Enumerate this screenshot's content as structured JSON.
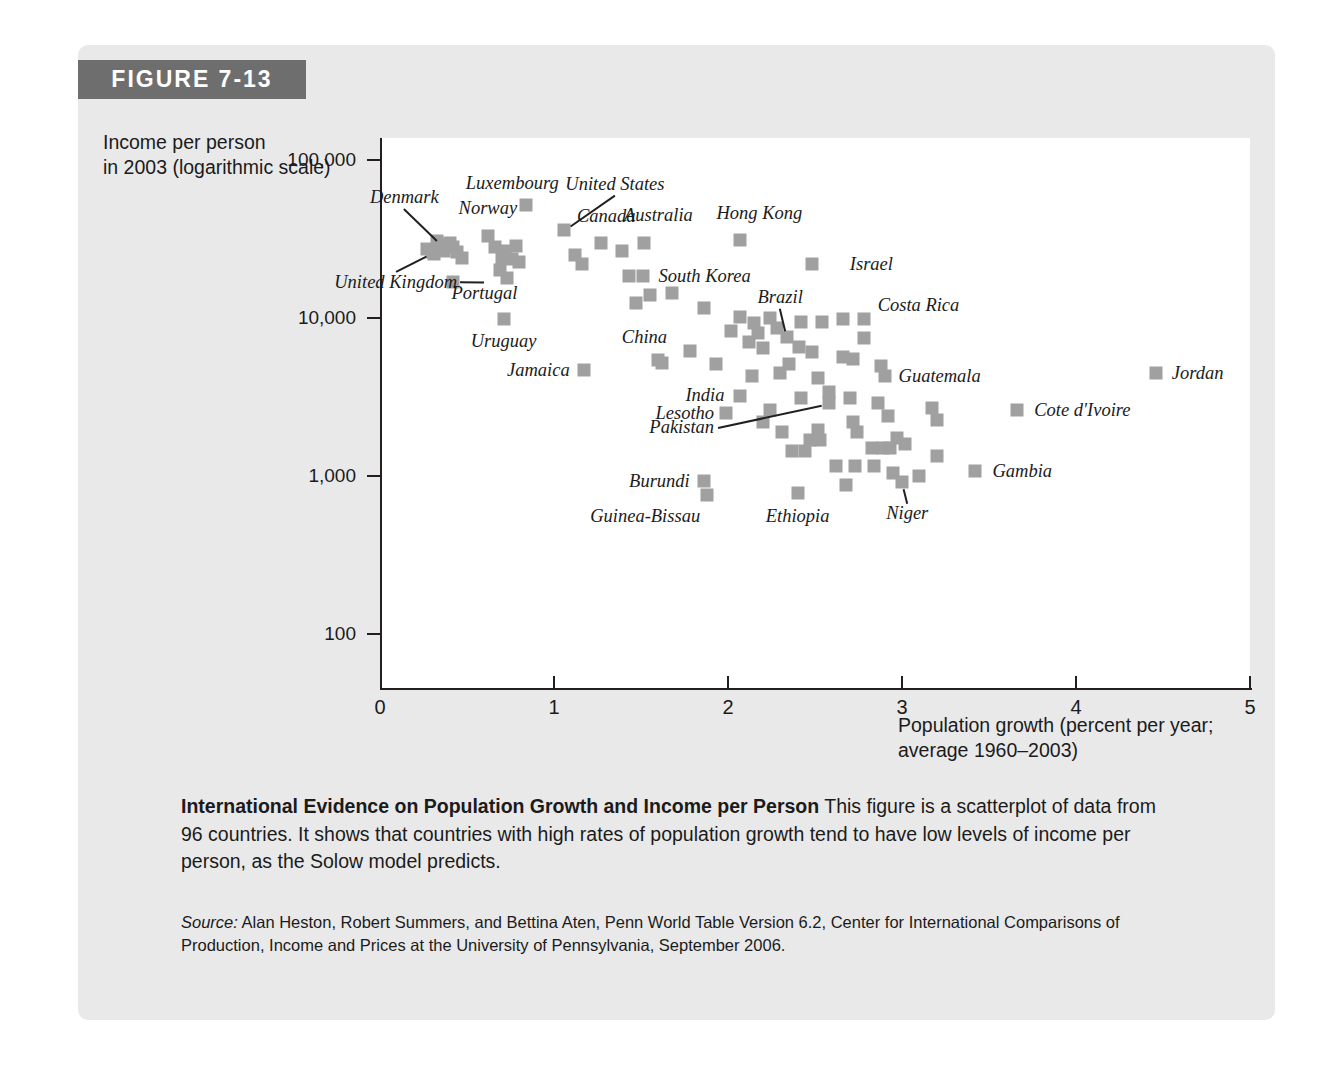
{
  "figure": {
    "banner_label": "FIGURE 7-13",
    "accent_color": "#6e6e6e",
    "card_color": "#e9e9e9",
    "marker_color": "#a0a0a0"
  },
  "caption": {
    "bold_lead": "International Evidence on Population Growth and Income per Person",
    "body": " This figure is a scatterplot of data from 96 countries. It shows that countries with high rates of population growth tend to have low levels of income per person, as the Solow model predicts.",
    "source_label": "Source:",
    "source_text": " Alan Heston, Robert Summers, and Bettina Aten, Penn World Table Version 6.2, Center for International Comparisons of Production, Income and Prices at the University of Pennsylvania, September 2006."
  },
  "chart_data": {
    "type": "scatter",
    "title": "International Evidence on Population Growth and Income per Person",
    "ylabel": "Income per person\nin 2003 (logarithmic scale)",
    "ylabel_line1": "Income per person",
    "ylabel_line2": "in 2003 (logarithmic scale)",
    "xlabel_line1": "Population growth (percent per year;",
    "xlabel_line2": "average 1960–2003)",
    "xlim": [
      0,
      5
    ],
    "ylim": [
      100,
      100000
    ],
    "yscale": "log",
    "grid": false,
    "legend": "none",
    "xticks": [
      "0",
      "1",
      "2",
      "3",
      "4",
      "5"
    ],
    "xtick_values": [
      0,
      1,
      2,
      3,
      4,
      5
    ],
    "yticks": [
      "100",
      "1,000",
      "10,000",
      "100,000"
    ],
    "ytick_values": [
      100,
      1000,
      10000,
      100000
    ],
    "n_countries": 96,
    "labeled_points": [
      {
        "name": "Luxembourg",
        "x": 0.84,
        "y": 52000,
        "lab_x": 0.76,
        "lab_y": 72000,
        "anchor": "c"
      },
      {
        "name": "United States",
        "x": 1.06,
        "y": 36000,
        "lab_x": 1.35,
        "lab_y": 70000,
        "anchor": "c",
        "leader": true
      },
      {
        "name": "Denmark",
        "x": 0.36,
        "y": 29000,
        "lab_x": 0.14,
        "lab_y": 58000,
        "anchor": "c",
        "leader": true
      },
      {
        "name": "Norway",
        "x": 0.62,
        "y": 33000,
        "lab_x": 0.62,
        "lab_y": 50000,
        "anchor": "c"
      },
      {
        "name": "Canada",
        "x": 1.27,
        "y": 30000,
        "lab_x": 1.3,
        "lab_y": 44000,
        "anchor": "c"
      },
      {
        "name": "Australia",
        "x": 1.52,
        "y": 30000,
        "lab_x": 1.6,
        "lab_y": 45000,
        "anchor": "c"
      },
      {
        "name": "Hong Kong",
        "x": 2.07,
        "y": 31000,
        "lab_x": 2.18,
        "lab_y": 46000,
        "anchor": "c"
      },
      {
        "name": "Israel",
        "x": 2.48,
        "y": 22000,
        "lab_x": 2.7,
        "lab_y": 22000,
        "anchor": "l"
      },
      {
        "name": "United Kingdom",
        "x": 0.3,
        "y": 26000,
        "lab_x": 0.09,
        "lab_y": 17000,
        "anchor": "c",
        "leader": true
      },
      {
        "name": "Portugal",
        "x": 0.42,
        "y": 17000,
        "lab_x": 0.6,
        "lab_y": 14500,
        "anchor": "c",
        "leader": true
      },
      {
        "name": "South Korea",
        "x": 1.51,
        "y": 18500,
        "lab_x": 1.6,
        "lab_y": 18500,
        "anchor": "l"
      },
      {
        "name": "Uruguay",
        "x": 0.71,
        "y": 9800,
        "lab_x": 0.71,
        "lab_y": 7200,
        "anchor": "c"
      },
      {
        "name": "Brazil",
        "x": 2.34,
        "y": 7600,
        "lab_x": 2.3,
        "lab_y": 13500,
        "anchor": "c",
        "leader": true
      },
      {
        "name": "Costa Rica",
        "x": 2.78,
        "y": 9800,
        "lab_x": 2.86,
        "lab_y": 12000,
        "anchor": "l"
      },
      {
        "name": "China",
        "x": 1.6,
        "y": 5400,
        "lab_x": 1.52,
        "lab_y": 7600,
        "anchor": "c"
      },
      {
        "name": "Jamaica",
        "x": 1.17,
        "y": 4700,
        "lab_x": 1.09,
        "lab_y": 4700,
        "anchor": "r"
      },
      {
        "name": "Guatemala",
        "x": 2.9,
        "y": 4300,
        "lab_x": 2.98,
        "lab_y": 4300,
        "anchor": "l"
      },
      {
        "name": "Jordan",
        "x": 4.46,
        "y": 4500,
        "lab_x": 4.55,
        "lab_y": 4500,
        "anchor": "l"
      },
      {
        "name": "India",
        "x": 2.07,
        "y": 3200,
        "lab_x": 1.98,
        "lab_y": 3250,
        "anchor": "r"
      },
      {
        "name": "Cote d'Ivoire",
        "x": 3.66,
        "y": 2600,
        "lab_x": 3.76,
        "lab_y": 2600,
        "anchor": "l"
      },
      {
        "name": "Lesotho",
        "x": 1.99,
        "y": 2500,
        "lab_x": 1.92,
        "lab_y": 2500,
        "anchor": "r"
      },
      {
        "name": "Pakistan",
        "x": 2.58,
        "y": 2900,
        "lab_x": 1.92,
        "lab_y": 2050,
        "anchor": "r",
        "leader": true
      },
      {
        "name": "Gambia",
        "x": 3.42,
        "y": 1080,
        "lab_x": 3.52,
        "lab_y": 1080,
        "anchor": "l"
      },
      {
        "name": "Burundi",
        "x": 1.86,
        "y": 930,
        "lab_x": 1.78,
        "lab_y": 930,
        "anchor": "r"
      },
      {
        "name": "Guinea-Bissau",
        "x": 1.88,
        "y": 760,
        "lab_x": 1.84,
        "lab_y": 560,
        "anchor": "r"
      },
      {
        "name": "Ethiopia",
        "x": 2.4,
        "y": 780,
        "lab_x": 2.4,
        "lab_y": 560,
        "anchor": "c"
      },
      {
        "name": "Niger",
        "x": 3.0,
        "y": 920,
        "lab_x": 3.03,
        "lab_y": 580,
        "anchor": "c",
        "leader": true
      }
    ],
    "unlabeled_points": [
      {
        "x": 0.27,
        "y": 27500
      },
      {
        "x": 0.33,
        "y": 30500
      },
      {
        "x": 0.4,
        "y": 30000
      },
      {
        "x": 0.42,
        "y": 28000
      },
      {
        "x": 0.31,
        "y": 25500
      },
      {
        "x": 0.37,
        "y": 26500
      },
      {
        "x": 0.44,
        "y": 26000
      },
      {
        "x": 0.47,
        "y": 24000
      },
      {
        "x": 0.66,
        "y": 28000
      },
      {
        "x": 0.72,
        "y": 26500
      },
      {
        "x": 0.78,
        "y": 28500
      },
      {
        "x": 0.7,
        "y": 24000
      },
      {
        "x": 0.76,
        "y": 23500
      },
      {
        "x": 0.8,
        "y": 22500
      },
      {
        "x": 0.69,
        "y": 20000
      },
      {
        "x": 0.73,
        "y": 18000
      },
      {
        "x": 1.12,
        "y": 25000
      },
      {
        "x": 1.16,
        "y": 22000
      },
      {
        "x": 1.39,
        "y": 26500
      },
      {
        "x": 1.43,
        "y": 18500
      },
      {
        "x": 1.55,
        "y": 14000
      },
      {
        "x": 1.47,
        "y": 12500
      },
      {
        "x": 1.68,
        "y": 14500
      },
      {
        "x": 1.86,
        "y": 11500
      },
      {
        "x": 2.07,
        "y": 10200
      },
      {
        "x": 2.15,
        "y": 9300
      },
      {
        "x": 2.24,
        "y": 10000
      },
      {
        "x": 2.02,
        "y": 8300
      },
      {
        "x": 2.17,
        "y": 8000
      },
      {
        "x": 2.28,
        "y": 8600
      },
      {
        "x": 2.12,
        "y": 7000
      },
      {
        "x": 2.2,
        "y": 6500
      },
      {
        "x": 2.42,
        "y": 9400
      },
      {
        "x": 2.54,
        "y": 9500
      },
      {
        "x": 2.66,
        "y": 9900
      },
      {
        "x": 2.41,
        "y": 6600
      },
      {
        "x": 2.48,
        "y": 6100
      },
      {
        "x": 2.78,
        "y": 7500
      },
      {
        "x": 2.66,
        "y": 5700
      },
      {
        "x": 2.72,
        "y": 5500
      },
      {
        "x": 2.88,
        "y": 5000
      },
      {
        "x": 2.35,
        "y": 5100
      },
      {
        "x": 2.3,
        "y": 4500
      },
      {
        "x": 1.93,
        "y": 5100
      },
      {
        "x": 2.14,
        "y": 4300
      },
      {
        "x": 2.52,
        "y": 4200
      },
      {
        "x": 1.78,
        "y": 6200
      },
      {
        "x": 1.62,
        "y": 5200
      },
      {
        "x": 2.58,
        "y": 3400
      },
      {
        "x": 2.7,
        "y": 3100
      },
      {
        "x": 2.86,
        "y": 2900
      },
      {
        "x": 3.17,
        "y": 2700
      },
      {
        "x": 2.42,
        "y": 3100
      },
      {
        "x": 2.24,
        "y": 2600
      },
      {
        "x": 2.2,
        "y": 2200
      },
      {
        "x": 2.31,
        "y": 1900
      },
      {
        "x": 2.47,
        "y": 1700
      },
      {
        "x": 2.37,
        "y": 1450
      },
      {
        "x": 2.44,
        "y": 1450
      },
      {
        "x": 2.72,
        "y": 2200
      },
      {
        "x": 2.74,
        "y": 1900
      },
      {
        "x": 2.52,
        "y": 1950
      },
      {
        "x": 2.92,
        "y": 2400
      },
      {
        "x": 2.97,
        "y": 1750
      },
      {
        "x": 2.83,
        "y": 1500
      },
      {
        "x": 2.89,
        "y": 1500
      },
      {
        "x": 2.93,
        "y": 1500
      },
      {
        "x": 3.02,
        "y": 1600
      },
      {
        "x": 3.2,
        "y": 1330
      },
      {
        "x": 3.2,
        "y": 2250
      },
      {
        "x": 2.62,
        "y": 1150
      },
      {
        "x": 2.73,
        "y": 1150
      },
      {
        "x": 2.84,
        "y": 1150
      },
      {
        "x": 2.95,
        "y": 1050
      },
      {
        "x": 3.1,
        "y": 1000
      },
      {
        "x": 2.68,
        "y": 880
      },
      {
        "x": 2.53,
        "y": 1700
      }
    ]
  }
}
